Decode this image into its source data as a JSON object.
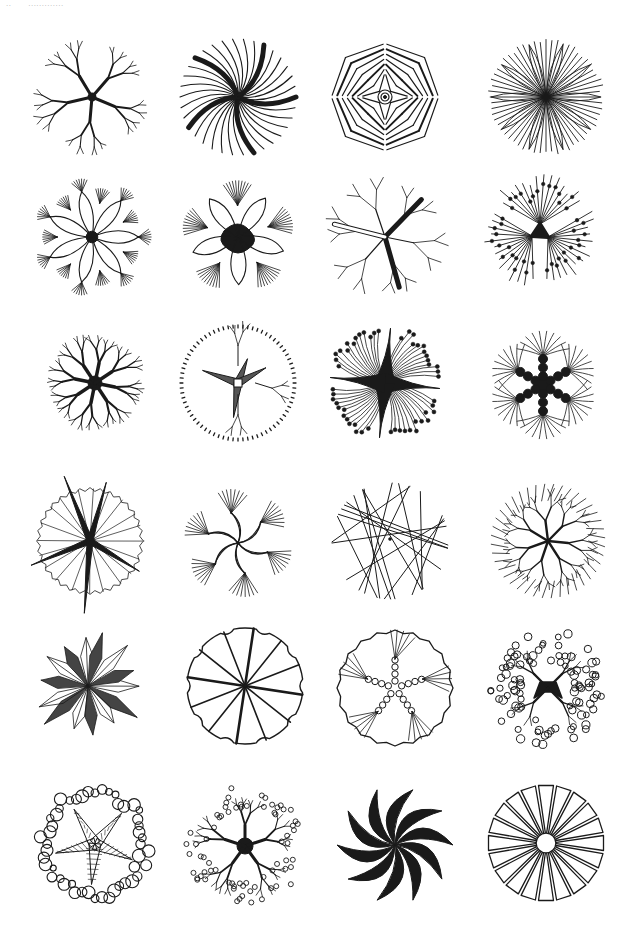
{
  "page": {
    "header": {
      "page_number": "··",
      "running_head": "·············"
    },
    "ink_color": "#1a1a1a",
    "paper_color": "#ffffff"
  },
  "plate": {
    "title": "Tree plan symbols",
    "rows": 6,
    "cols": 4,
    "symbols": [
      {
        "id": 1,
        "row": 1,
        "col": 1,
        "cx": 92,
        "cy": 97,
        "r": 58,
        "style": "branching-trunk-hatched"
      },
      {
        "id": 2,
        "row": 1,
        "col": 2,
        "cx": 238,
        "cy": 97,
        "r": 58,
        "style": "sweeping-lines-bold-strokes"
      },
      {
        "id": 3,
        "row": 1,
        "col": 3,
        "cx": 385,
        "cy": 97,
        "r": 58,
        "style": "chevron-lines-center-rings"
      },
      {
        "id": 4,
        "row": 1,
        "col": 4,
        "cx": 546,
        "cy": 97,
        "r": 58,
        "style": "dense-radial-leaves"
      },
      {
        "id": 5,
        "row": 2,
        "col": 1,
        "cx": 92,
        "cy": 237,
        "r": 58,
        "style": "petal-lobes-fan-edge"
      },
      {
        "id": 6,
        "row": 2,
        "col": 2,
        "cx": 238,
        "cy": 237,
        "r": 58,
        "style": "petal-lobes-solid-center"
      },
      {
        "id": 7,
        "row": 2,
        "col": 3,
        "cx": 385,
        "cy": 237,
        "r": 58,
        "style": "open-branches-hatched-trunk"
      },
      {
        "id": 8,
        "row": 2,
        "col": 4,
        "cx": 540,
        "cy": 232,
        "r": 58,
        "style": "radial-lines-dots"
      },
      {
        "id": 9,
        "row": 3,
        "col": 1,
        "cx": 95,
        "cy": 383,
        "r": 58,
        "style": "dendritic-solid"
      },
      {
        "id": 10,
        "row": 3,
        "col": 2,
        "cx": 238,
        "cy": 383,
        "r": 58,
        "style": "dashed-edge-star-trunk"
      },
      {
        "id": 11,
        "row": 3,
        "col": 3,
        "cx": 385,
        "cy": 383,
        "r": 58,
        "style": "solid-cross-dotted-fringe"
      },
      {
        "id": 12,
        "row": 3,
        "col": 4,
        "cx": 543,
        "cy": 385,
        "r": 58,
        "style": "beaded-arms-arc-fringe"
      },
      {
        "id": 13,
        "row": 4,
        "col": 1,
        "cx": 90,
        "cy": 541,
        "r": 58,
        "style": "serrated-edge-starburst"
      },
      {
        "id": 14,
        "row": 4,
        "col": 2,
        "cx": 238,
        "cy": 543,
        "r": 56,
        "style": "curved-branches-fringe"
      },
      {
        "id": 15,
        "row": 4,
        "col": 3,
        "cx": 390,
        "cy": 541,
        "r": 58,
        "style": "straight-line-web"
      },
      {
        "id": 16,
        "row": 4,
        "col": 4,
        "cx": 548,
        "cy": 541,
        "r": 58,
        "style": "irregular-branches-dense"
      },
      {
        "id": 17,
        "row": 5,
        "col": 1,
        "cx": 88,
        "cy": 686,
        "r": 56,
        "style": "spiky-starburst"
      },
      {
        "id": 18,
        "row": 5,
        "col": 2,
        "cx": 245,
        "cy": 686,
        "r": 58,
        "style": "notched-circle-spokes"
      },
      {
        "id": 19,
        "row": 5,
        "col": 3,
        "cx": 395,
        "cy": 688,
        "r": 58,
        "style": "scalloped-circle-coils"
      },
      {
        "id": 20,
        "row": 5,
        "col": 4,
        "cx": 548,
        "cy": 688,
        "r": 58,
        "style": "bubble-foliage-solid-trunk"
      },
      {
        "id": 21,
        "row": 6,
        "col": 1,
        "cx": 95,
        "cy": 844,
        "r": 58,
        "style": "bubble-edge-hatched-trunk"
      },
      {
        "id": 22,
        "row": 6,
        "col": 2,
        "cx": 245,
        "cy": 846,
        "r": 60,
        "style": "bubble-twigs-solid-trunk"
      },
      {
        "id": 23,
        "row": 6,
        "col": 3,
        "cx": 395,
        "cy": 845,
        "r": 58,
        "style": "pinwheel-crescents"
      },
      {
        "id": 24,
        "row": 6,
        "col": 4,
        "cx": 546,
        "cy": 843,
        "r": 58,
        "style": "wedge-rays-hub"
      }
    ]
  }
}
